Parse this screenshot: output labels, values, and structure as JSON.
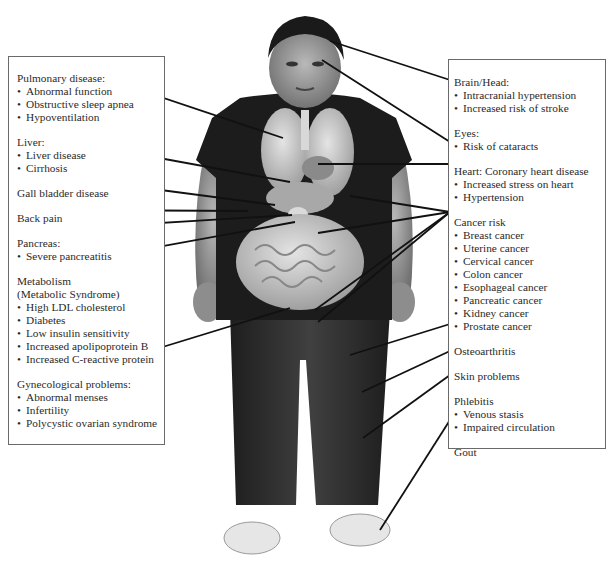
{
  "left_panel": {
    "groups": [
      {
        "heading": "Pulmonary disease:",
        "items": [
          "Abnormal function",
          "Obstructive sleep apnea",
          "Hypoventilation"
        ]
      },
      {
        "heading": "Liver:",
        "items": [
          "Liver disease",
          "Cirrhosis"
        ]
      },
      {
        "heading": "Gall bladder disease",
        "items": []
      },
      {
        "heading": "Back pain",
        "items": []
      },
      {
        "heading": "Pancreas:",
        "items": [
          "Severe pancreatitis"
        ]
      },
      {
        "heading": "Metabolism",
        "subheading": "(Metabolic Syndrome)",
        "items": [
          "High LDL cholesterol",
          "Diabetes",
          "Low insulin sensitivity",
          "Increased apolipoprotein B",
          "Increased C-reactive protein"
        ]
      },
      {
        "heading": "Gynecological problems:",
        "items": [
          "Abnormal menses",
          "Infertility",
          "Polycystic ovarian syndrome"
        ]
      }
    ]
  },
  "right_panel": {
    "groups": [
      {
        "heading": "Brain/Head:",
        "items": [
          "Intracranial hypertension",
          "Increased risk of stroke"
        ]
      },
      {
        "heading": "Eyes:",
        "items": [
          "Risk of cataracts"
        ]
      },
      {
        "heading": "Heart: Coronary heart disease",
        "items": [
          "Increased stress on heart",
          "Hypertension"
        ]
      },
      {
        "heading": "Cancer risk",
        "items": [
          "Breast cancer",
          "Uterine cancer",
          "Cervical cancer",
          "Colon cancer",
          "Esophageal cancer",
          "Pancreatic cancer",
          "Kidney cancer",
          "Prostate cancer"
        ]
      },
      {
        "heading": "Osteoarthritis",
        "items": []
      },
      {
        "heading": "Skin problems",
        "items": []
      },
      {
        "heading": "Phlebitis",
        "items": [
          "Venous stasis",
          "Impaired circulation"
        ]
      },
      {
        "heading": "Gout",
        "items": []
      }
    ]
  },
  "colors": {
    "box_border": "#6a6a6a",
    "text": "#2a2a2a",
    "shirt": "#1c1c1c",
    "pants": "#2e2e2e",
    "skin": "#8a8a8a",
    "organs": "#c8c8c8",
    "leader_line": "#111111"
  }
}
